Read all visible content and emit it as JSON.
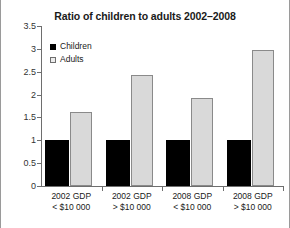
{
  "chart_data": {
    "type": "bar",
    "title": "Ratio of children to adults 2002–2008",
    "xlabel": "",
    "ylabel": "",
    "ylim": [
      0,
      3.5
    ],
    "ytick_labels": [
      "0",
      "0.5",
      "1",
      "1.5",
      "2",
      "2.5",
      "3",
      "3.5"
    ],
    "ytick_values": [
      0,
      0.5,
      1,
      1.5,
      2,
      2.5,
      3,
      3.5
    ],
    "grid": false,
    "legend_position": "upper-left-inside",
    "categories": [
      "2002 GDP < $10 000",
      "2002 GDP > $10 000",
      "2008 GDP < $10 000",
      "2008 GDP > $10 000"
    ],
    "category_lines": [
      [
        "2002 GDP",
        "< $10 000"
      ],
      [
        "2002 GDP",
        "> $10 000"
      ],
      [
        "2008 GDP",
        "< $10 000"
      ],
      [
        "2008 GDP",
        "> $10 000"
      ]
    ],
    "series": [
      {
        "name": "Children",
        "color": "#000000",
        "values": [
          1,
          1,
          1,
          1
        ]
      },
      {
        "name": "Adults",
        "color": "#d9d9d9",
        "values": [
          1.63,
          2.42,
          1.93,
          2.98
        ]
      }
    ]
  },
  "legend": {
    "items": [
      {
        "label": "Children",
        "swatch": "black-square-swatch"
      },
      {
        "label": "Adults",
        "swatch": "light-square-swatch"
      }
    ]
  }
}
